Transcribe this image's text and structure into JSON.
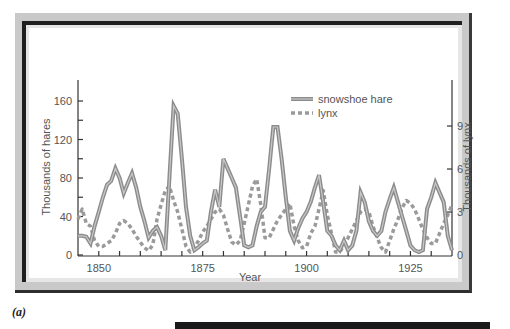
{
  "caption": "(a)",
  "chart_data": {
    "type": "line",
    "title": "",
    "xlabel": "Year",
    "ylabel": "Thousands of hares",
    "y2label": "Thousands of lynx",
    "xlim": [
      1845,
      1935
    ],
    "ylim": [
      0,
      180
    ],
    "y2lim": [
      0,
      12.5
    ],
    "xticks": [
      1850,
      1875,
      1900,
      1925
    ],
    "yticks": [
      0,
      40,
      80,
      120,
      160
    ],
    "y2ticks": [
      0,
      3,
      6,
      9
    ],
    "grid": false,
    "legend_position": "upper right",
    "x": [
      1845,
      1846,
      1847,
      1848,
      1849,
      1850,
      1851,
      1852,
      1853,
      1854,
      1855,
      1856,
      1857,
      1858,
      1859,
      1860,
      1861,
      1862,
      1863,
      1864,
      1865,
      1866,
      1867,
      1868,
      1869,
      1870,
      1871,
      1872,
      1873,
      1874,
      1875,
      1876,
      1877,
      1878,
      1879,
      1880,
      1881,
      1882,
      1883,
      1884,
      1885,
      1886,
      1887,
      1888,
      1889,
      1890,
      1891,
      1892,
      1893,
      1894,
      1895,
      1896,
      1897,
      1898,
      1899,
      1900,
      1901,
      1902,
      1903,
      1904,
      1905,
      1906,
      1907,
      1908,
      1909,
      1910,
      1911,
      1912,
      1913,
      1914,
      1915,
      1916,
      1917,
      1918,
      1919,
      1920,
      1921,
      1922,
      1923,
      1924,
      1925,
      1926,
      1927,
      1928,
      1929,
      1930,
      1931,
      1932,
      1933,
      1934,
      1935
    ],
    "series": [
      {
        "name": "snowshoe hare",
        "axis": "left",
        "style": "double-line",
        "values": [
          20,
          20,
          19,
          12,
          30,
          45,
          60,
          73,
          77,
          90,
          80,
          64,
          75,
          85,
          70,
          50,
          35,
          18,
          25,
          29,
          20,
          5,
          80,
          155,
          147,
          100,
          50,
          20,
          5,
          8,
          12,
          15,
          45,
          68,
          50,
          100,
          90,
          80,
          70,
          40,
          10,
          8,
          10,
          30,
          45,
          50,
          90,
          133,
          133,
          100,
          60,
          25,
          15,
          28,
          38,
          45,
          55,
          70,
          83,
          55,
          25,
          20,
          10,
          5,
          15,
          5,
          10,
          25,
          65,
          55,
          35,
          25,
          20,
          25,
          45,
          58,
          70,
          55,
          40,
          25,
          10,
          5,
          3,
          5,
          48,
          60,
          75,
          65,
          55,
          20,
          5
        ]
      },
      {
        "name": "lynx",
        "axis": "right",
        "style": "dashed",
        "values": [
          2.5,
          3.2,
          2.2,
          2.0,
          1.0,
          0.6,
          0.6,
          0.8,
          1.0,
          1.5,
          2.2,
          2.4,
          2.2,
          1.8,
          1.3,
          0.9,
          0.5,
          0.3,
          0.7,
          2.5,
          3.5,
          4.5,
          4.8,
          3.8,
          3.0,
          1.8,
          0.6,
          0.2,
          0.5,
          1.0,
          1.6,
          2.0,
          2.5,
          3.0,
          3.2,
          2.8,
          1.8,
          0.9,
          0.7,
          1.0,
          2.2,
          3.5,
          4.8,
          5.3,
          3.5,
          1.2,
          1.2,
          1.8,
          2.4,
          2.8,
          3.2,
          3.6,
          2.0,
          1.0,
          0.5,
          0.6,
          1.5,
          2.0,
          3.2,
          4.5,
          2.8,
          1.5,
          0.2,
          0.2,
          0.7,
          1.2,
          1.8,
          2.4,
          3.0,
          3.2,
          3.0,
          2.0,
          1.2,
          0.5,
          0.2,
          1.0,
          1.8,
          2.5,
          3.3,
          3.8,
          3.6,
          3.2,
          2.5,
          1.8,
          1.2,
          0.8,
          0.8,
          1.5,
          2.2,
          2.8,
          3.5
        ]
      }
    ],
    "legend": [
      {
        "label": "snowshoe hare",
        "style": "double-line"
      },
      {
        "label": "lynx",
        "style": "dashed"
      }
    ]
  },
  "axes": {
    "left_title": "Thousands of hares",
    "right_title": "Thousands of lynx",
    "x_title": "Year",
    "left_ticks": [
      "0",
      "40",
      "80",
      "120",
      "160"
    ],
    "right_ticks": [
      "0",
      "3",
      "6",
      "9"
    ],
    "x_ticks": [
      "1850",
      "1875",
      "1900",
      "1925"
    ]
  },
  "legend": {
    "hare": "snowshoe hare",
    "lynx": "lynx"
  },
  "colors": {
    "series_line": "#8c8c8c",
    "series_inner": "#ffffff",
    "axis": "#333333",
    "text": "#555555",
    "frame_light": "#c9c9c9",
    "frame_dark": "#1f1f1f"
  }
}
